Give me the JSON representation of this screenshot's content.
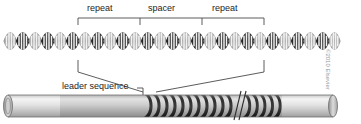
{
  "figure": {
    "credit": "©2010 Elsevier",
    "top_brackets": {
      "segments": [
        {
          "label": "repeat",
          "x_start": 78,
          "x_end": 140
        },
        {
          "label": "spacer",
          "x_start": 140,
          "x_end": 202
        },
        {
          "label": "repeat",
          "x_start": 202,
          "x_end": 264
        }
      ],
      "bracket_y": 18,
      "tick_length": 7
    },
    "helix": {
      "name": "dna-double-helix",
      "x_start": 4,
      "x_end": 340,
      "center_y": 41,
      "amplitude": 11,
      "period": 25,
      "rungs_per_period": 4,
      "segment_colors": [
        "#b9b9b9",
        "#3f3f3f"
      ],
      "strand_color_light": "#9c9c9c",
      "strand_color_dark": "#2e2e2e",
      "rung_color": "#f2f2f2"
    },
    "connectors": {
      "name": "bracket-to-cylinder-leaders",
      "left_top_x": 78,
      "right_top_x": 264,
      "top_y": 60,
      "drop_y": 74,
      "left_bottom_x": 143,
      "right_bottom_x": 156,
      "bottom_y": 92
    },
    "cylinder": {
      "name": "crispr-locus-cylinder",
      "x_start": 8,
      "x_end": 333,
      "center_y": 106,
      "radius_y": 10,
      "leader_label": "leader sequence",
      "leader_callout": {
        "x": 143,
        "y_top": 88,
        "y_bottom": 96
      },
      "body_light": "#ededed",
      "body_mid": "#cfcfcf",
      "body_dark": "#a8a8a8",
      "band_color": "#3a3a3a",
      "leader_segment": {
        "x_start": 8,
        "x_end": 60
      },
      "plain_segment": {
        "x_start": 60,
        "x_end": 145
      },
      "array_left": {
        "x_start": 145,
        "x_end": 233,
        "band_count": 11
      },
      "break_mark": {
        "x": 236,
        "width": 8
      },
      "array_right": {
        "x_start": 244,
        "x_end": 282,
        "band_count": 5
      },
      "tail_segment": {
        "x_start": 282,
        "x_end": 333
      }
    }
  }
}
